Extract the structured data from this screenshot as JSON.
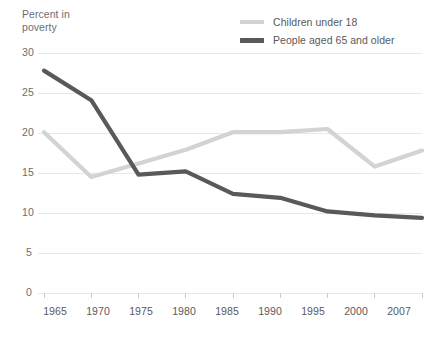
{
  "chart_data": {
    "type": "line",
    "title": "",
    "subtitle": "",
    "xlabel": "",
    "ylabel": "Percent in\npoverty",
    "categories": [
      "1965",
      "1970",
      "1975",
      "1980",
      "1985",
      "1990",
      "1995",
      "2000",
      "2007"
    ],
    "x": [
      1965,
      1970,
      1975,
      1980,
      1985,
      1990,
      1995,
      2000,
      2007
    ],
    "series": [
      {
        "name": "Children under 18",
        "color": "#d2d3d4",
        "values": [
          20.1,
          14.5,
          16.2,
          17.9,
          20.1,
          20.1,
          20.5,
          15.8,
          17.8
        ]
      },
      {
        "name": "People aged 65 and older",
        "color": "#58595b",
        "values": [
          27.8,
          24.1,
          14.8,
          15.2,
          12.4,
          11.9,
          10.2,
          9.7,
          9.4
        ]
      }
    ],
    "ylim": [
      0,
      30
    ],
    "yticks": [
      0,
      5,
      10,
      15,
      20,
      25,
      30
    ],
    "ytick_labels": [
      "0",
      "5",
      "10",
      "15",
      "20",
      "25",
      "30"
    ],
    "grid": "horizontal",
    "legend_position": "top-right",
    "background": "#ffffff",
    "gridline_color": "#e8e8e9",
    "axis_color": "#c9cacb"
  },
  "legend": {
    "items": [
      {
        "label": "Children under 18",
        "color": "#d2d3d4"
      },
      {
        "label": "People aged 65 and older",
        "color": "#58595b"
      }
    ]
  },
  "axis": {
    "y_title": "Percent in\npoverty",
    "y_labels": [
      "30",
      "25",
      "20",
      "15",
      "10",
      "5",
      "0"
    ],
    "x_labels": [
      "1965",
      "1970",
      "1975",
      "1980",
      "1985",
      "1990",
      "1995",
      "2000",
      "2007"
    ]
  }
}
